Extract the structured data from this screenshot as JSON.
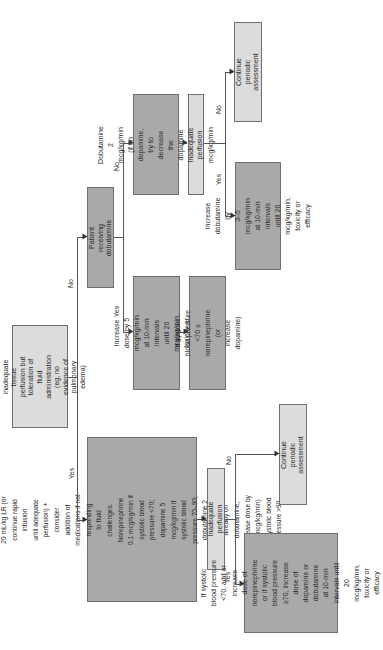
{
  "flowchart": {
    "orientation": "rotated-90-ccw",
    "colors": {
      "dark_box": "#a9a9a9",
      "light_box": "#dcdcdc",
      "line": "#555555"
    },
    "nodes": {
      "start": "Continued inadequate tissue\nperfusion but toleration of\nfluid administration\n(eg, no evidence of\npulmonary edema)",
      "fluid": "20 mL/kg LR (or continue rapid infusion\nuntil adequate perfusion) + consider\naddition of medications if not responding\nto fluid challenges. Norepinephrine\n0.1 mcg/kg/min if systolic blood\npressure <70; dopamine 5 mcg/kg/min if\nsystolic blood pressure 70–90;\ndobutamine 2 mcg/kg/min (if already on\ndobutamine, increase dose by 5 mcg/kg/min)\nif systolic blood pressure >90",
      "inadequate_bottom": "Inadequate perfusion",
      "continue_bottom": "Continue periodic\nassessment",
      "systolic_bottom": "If systolic blood pressure\n<70, add or increase\ndose of norepinephrine\nor if systolic blood pressure\n≥70, increase dose of\ndopamine or dobutamine\nat 10-min intervals until\n20 mcg/kg/min,\ntoxicity or efficacy",
      "patient_dobutamine": "Patient receiving\ndobutamine",
      "increase_dose": "Increase dose by 5 mcg/kg/min\nat 10-min intervals\nuntil 20 mcg/kg/min,\ntoxicity or efficacy",
      "systolic_mid": "If systolic blood pressure\n<70 ± norepinephrine (or\nincrease dopamine)",
      "dobutamine_2": "Dobutamine 2 mcg/kg/min\n(if on dopamine, try to\ndecrease the dopamine to\n3 mcg/kg/min",
      "inadequate_top": "Inadequate perfusion",
      "continue_top": "Continue periodic\nassessment",
      "increase_dobutamine": "Increase dobutamine by\n3–5 mcg/kg/min at 10-min\nintervals until 20 mcg/kg/min,\ntoxicity or efficacy"
    },
    "labels": {
      "start_yes": "Yes",
      "start_no": "No",
      "patient_yes": "Yes",
      "patient_no": "No",
      "top_yes": "Yes",
      "top_no": "No",
      "bottom_yes": "Yes",
      "bottom_no": "No"
    }
  }
}
